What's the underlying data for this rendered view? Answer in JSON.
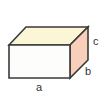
{
  "figure": {
    "name": "rectangular-prism-diagram",
    "type": "3d-rectangular-prism",
    "background_color": "#ffffff",
    "edge_color": "#3a3a3a",
    "faces": {
      "front": {
        "name": "front-face",
        "color": "#fdfdfb"
      },
      "top": {
        "name": "top-face",
        "color": "#fbf6d5"
      },
      "right": {
        "name": "right-face",
        "color": "#f8cfbb"
      }
    },
    "labels": {
      "length": "a",
      "depth": "b",
      "height": "c"
    }
  }
}
